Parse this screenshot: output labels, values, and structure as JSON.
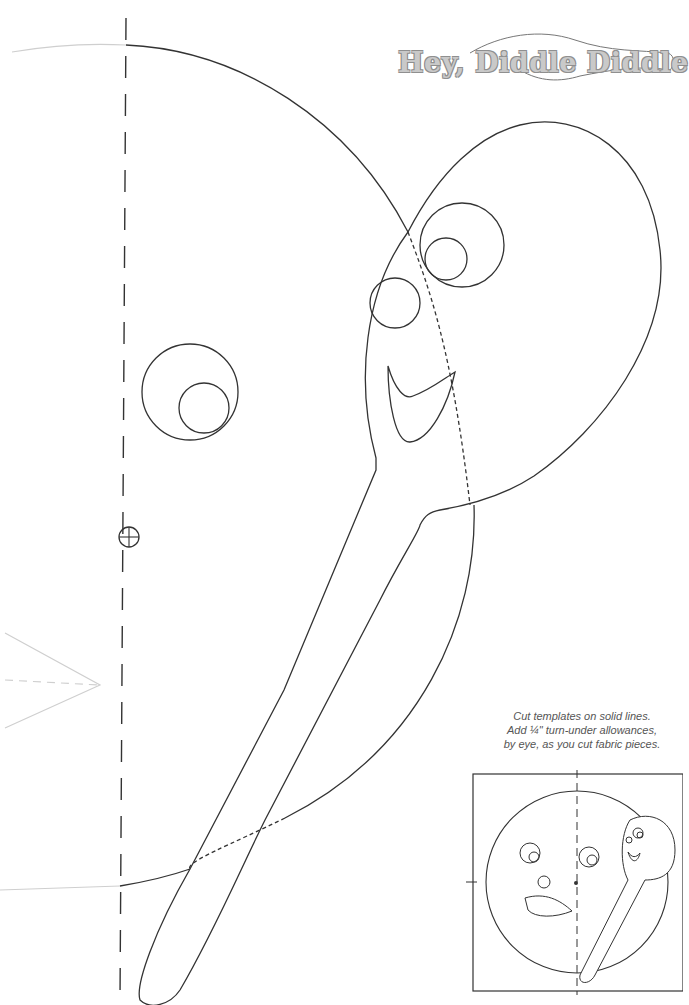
{
  "page": {
    "title": "Hey, Diddle Diddle",
    "instructions": [
      "Cut templates on solid lines.",
      "Add ¼\" turn-under allowances,",
      "by eye, as you cut fabric pieces."
    ]
  },
  "pattern": {
    "line_color": "#333333",
    "ghost_line_color": "#c8c8c8",
    "title_fill": "#c9c9c9",
    "title_outline": "#8f8f8f",
    "pieces": [
      {
        "name": "moon-face",
        "type": "circle-arc"
      },
      {
        "name": "moon-eye-outer",
        "type": "circle"
      },
      {
        "name": "moon-eye-inner",
        "type": "circle"
      },
      {
        "name": "spoon",
        "type": "spoon-outline"
      },
      {
        "name": "spoon-eye-outer",
        "type": "circle"
      },
      {
        "name": "spoon-eye-inner",
        "type": "circle"
      },
      {
        "name": "spoon-nose",
        "type": "circle"
      },
      {
        "name": "spoon-mouth",
        "type": "crescent"
      }
    ],
    "markers": [
      {
        "name": "fold-line",
        "style": "dashed"
      },
      {
        "name": "registration-mark",
        "style": "crosshair-circle"
      }
    ]
  },
  "placement_diagram": {
    "label": "layout thumbnail"
  }
}
